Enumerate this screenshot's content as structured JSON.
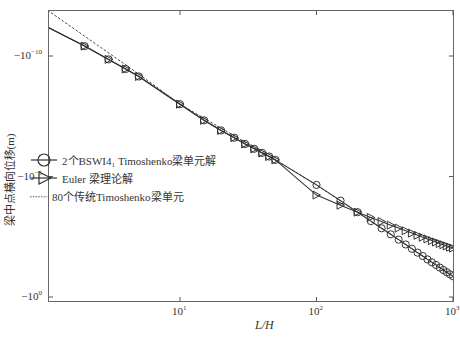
{
  "chart_data": {
    "type": "line",
    "title": "",
    "xlabel": "L/H",
    "ylabel": "梁中点横向位移(m)",
    "xscale": "log",
    "yscale": "log (negative values, magnitude increasing downward)",
    "xlim": [
      1.07,
      1000
    ],
    "ylim_exponent": [
      -11.9,
      0.2
    ],
    "x_ticks": [
      {
        "base": "10",
        "exp": "1",
        "value": 10
      },
      {
        "base": "10",
        "exp": "2",
        "value": 100
      },
      {
        "base": "10",
        "exp": "3",
        "value": 1000
      }
    ],
    "y_ticks": [
      {
        "prefix": "−10",
        "exp": "−10",
        "value": -1e-10
      },
      {
        "prefix": "−10",
        "exp": "−5",
        "value": -1e-05
      },
      {
        "prefix": "−10",
        "exp": "0",
        "value": -1
      }
    ],
    "grid": false,
    "legend_position": "center-left",
    "series": [
      {
        "name": "2个BSWI4₁ Timoshenko梁单元解",
        "marker": "circle",
        "line": "solid",
        "x": [
          1.07,
          2,
          3,
          4,
          5,
          10,
          15,
          20,
          25,
          30,
          35,
          40,
          45,
          50,
          100,
          150,
          200,
          250,
          300,
          350,
          400,
          450,
          500,
          550,
          600,
          650,
          700,
          750,
          800,
          850,
          900,
          950,
          1000
        ],
        "log10_abs_y": [
          -11.2,
          -10.41,
          -9.86,
          -9.46,
          -9.15,
          -8.0,
          -7.33,
          -6.91,
          -6.61,
          -6.35,
          -6.15,
          -5.98,
          -5.83,
          -5.69,
          -4.65,
          -4.0,
          -3.52,
          -3.15,
          -2.85,
          -2.6,
          -2.38,
          -2.18,
          -2.0,
          -1.84,
          -1.7,
          -1.56,
          -1.44,
          -1.33,
          -1.22,
          -1.12,
          -1.03,
          -0.94,
          -0.86
        ]
      },
      {
        "name": "Euler  梁理论解",
        "marker": "triangle-right",
        "line": "solid",
        "x": [
          1.07,
          2,
          3,
          4,
          5,
          10,
          15,
          20,
          25,
          30,
          35,
          40,
          45,
          50,
          100,
          150,
          200,
          250,
          300,
          350,
          400,
          450,
          500,
          550,
          600,
          650,
          700,
          750,
          800,
          850,
          900,
          950,
          1000
        ],
        "log10_abs_y": [
          -11.2,
          -10.41,
          -9.86,
          -9.46,
          -9.15,
          -8.0,
          -7.33,
          -6.91,
          -6.61,
          -6.35,
          -6.15,
          -5.98,
          -5.83,
          -5.69,
          -4.23,
          -3.81,
          -3.52,
          -3.3,
          -3.13,
          -2.98,
          -2.86,
          -2.75,
          -2.65,
          -2.56,
          -2.48,
          -2.41,
          -2.34,
          -2.28,
          -2.22,
          -2.17,
          -2.12,
          -2.07,
          -2.03
        ]
      },
      {
        "name": "80个传统Timoshenko梁单元",
        "marker": "none",
        "line": "dashed",
        "x": [
          1.07,
          5,
          10,
          50,
          100,
          1000
        ],
        "log10_abs_y": [
          -11.9,
          -9.25,
          -8.0,
          -5.69,
          -4.65,
          -0.86
        ]
      }
    ]
  },
  "legend": {
    "items": [
      {
        "label": "2个BSWI4₁ Timoshenko梁单元解",
        "marker": "circle",
        "line": "solid"
      },
      {
        "label": "Euler  梁理论解",
        "marker": "triangle-right",
        "line": "solid"
      },
      {
        "label": "80个传统Timoshenko梁单元",
        "marker": "none",
        "line": "dashed"
      }
    ]
  },
  "colors": {
    "line": "#333333",
    "axis": "#555555",
    "background": "#ffffff"
  }
}
